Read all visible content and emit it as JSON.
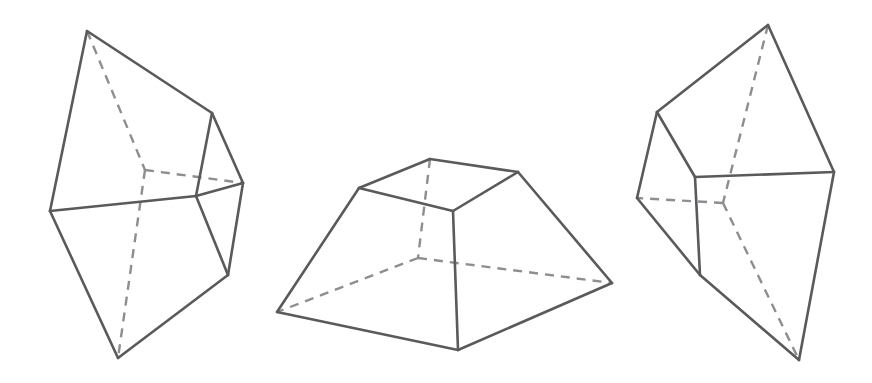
{
  "page": {
    "background_color": "#ffffff",
    "width": 872,
    "height": 383
  },
  "style": {
    "solid_edge_color": "#5a5a5c",
    "hidden_edge_color": "#8e8e92",
    "solid_edge_width": 2.6,
    "hidden_edge_width": 2.4,
    "hidden_dash_pattern": "9 7"
  },
  "figures": [
    {
      "id": "figure-left",
      "name": "left-polyhedron",
      "description": "Truncated pyramid (frustum) tilted, viewed from upper left; bottom apex points down-left",
      "vertices": {
        "top_apex": [
          87,
          31
        ],
        "upper_right": [
          212,
          113
        ],
        "left": [
          50,
          211
        ],
        "right": [
          243,
          183
        ],
        "front_right": [
          228,
          275
        ],
        "bottom_apex": [
          118,
          358
        ],
        "hidden_center": [
          145,
          170
        ],
        "front_mid": [
          196,
          196
        ]
      },
      "solid_edges": [
        [
          [
            87,
            31
          ],
          [
            212,
            113
          ]
        ],
        [
          [
            87,
            31
          ],
          [
            50,
            211
          ]
        ],
        [
          [
            212,
            113
          ],
          [
            243,
            183
          ]
        ],
        [
          [
            50,
            211
          ],
          [
            196,
            196
          ]
        ],
        [
          [
            196,
            196
          ],
          [
            243,
            183
          ]
        ],
        [
          [
            196,
            196
          ],
          [
            212,
            113
          ]
        ],
        [
          [
            50,
            211
          ],
          [
            118,
            358
          ]
        ],
        [
          [
            118,
            358
          ],
          [
            228,
            275
          ]
        ],
        [
          [
            228,
            275
          ],
          [
            243,
            183
          ]
        ],
        [
          [
            196,
            196
          ],
          [
            228,
            275
          ]
        ]
      ],
      "hidden_edges": [
        [
          [
            87,
            31
          ],
          [
            145,
            170
          ]
        ],
        [
          [
            145,
            170
          ],
          [
            243,
            183
          ]
        ],
        [
          [
            145,
            170
          ],
          [
            118,
            358
          ]
        ]
      ]
    },
    {
      "id": "figure-middle",
      "name": "middle-polyhedron",
      "description": "Truncated square pyramid (frustum) resting on its base, viewed slightly from above",
      "vertices": {
        "top_back": [
          430,
          159
        ],
        "top_left": [
          359,
          188
        ],
        "top_right": [
          518,
          172
        ],
        "top_front": [
          453,
          211
        ],
        "bottom_back": [
          418,
          258
        ],
        "bottom_left": [
          277,
          312
        ],
        "bottom_right": [
          612,
          283
        ],
        "bottom_front": [
          458,
          350
        ]
      },
      "solid_edges": [
        [
          [
            359,
            188
          ],
          [
            430,
            159
          ]
        ],
        [
          [
            430,
            159
          ],
          [
            518,
            172
          ]
        ],
        [
          [
            518,
            172
          ],
          [
            453,
            211
          ]
        ],
        [
          [
            453,
            211
          ],
          [
            359,
            188
          ]
        ],
        [
          [
            359,
            188
          ],
          [
            277,
            312
          ]
        ],
        [
          [
            518,
            172
          ],
          [
            612,
            283
          ]
        ],
        [
          [
            453,
            211
          ],
          [
            458,
            350
          ]
        ],
        [
          [
            277,
            312
          ],
          [
            458,
            350
          ]
        ],
        [
          [
            458,
            350
          ],
          [
            612,
            283
          ]
        ]
      ],
      "hidden_edges": [
        [
          [
            430,
            159
          ],
          [
            418,
            258
          ]
        ],
        [
          [
            418,
            258
          ],
          [
            277,
            312
          ]
        ],
        [
          [
            418,
            258
          ],
          [
            612,
            283
          ]
        ]
      ]
    },
    {
      "id": "figure-right",
      "name": "right-polyhedron",
      "description": "Truncated pyramid (frustum) tilted, viewed from upper right; bottom apex points down-right",
      "vertices": {
        "top_apex": [
          768,
          25
        ],
        "upper_left": [
          657,
          112
        ],
        "left": [
          637,
          198
        ],
        "front_left": [
          695,
          177
        ],
        "right": [
          834,
          172
        ],
        "bottom_left": [
          700,
          275
        ],
        "bottom_apex": [
          799,
          360
        ],
        "hidden_center": [
          723,
          203
        ]
      },
      "solid_edges": [
        [
          [
            768,
            25
          ],
          [
            657,
            112
          ]
        ],
        [
          [
            768,
            25
          ],
          [
            834,
            172
          ]
        ],
        [
          [
            657,
            112
          ],
          [
            637,
            198
          ]
        ],
        [
          [
            657,
            112
          ],
          [
            695,
            177
          ]
        ],
        [
          [
            695,
            177
          ],
          [
            834,
            172
          ]
        ],
        [
          [
            637,
            198
          ],
          [
            700,
            275
          ]
        ],
        [
          [
            695,
            177
          ],
          [
            700,
            275
          ]
        ],
        [
          [
            700,
            275
          ],
          [
            799,
            360
          ]
        ],
        [
          [
            799,
            360
          ],
          [
            834,
            172
          ]
        ]
      ],
      "hidden_edges": [
        [
          [
            768,
            25
          ],
          [
            723,
            203
          ]
        ],
        [
          [
            723,
            203
          ],
          [
            637,
            198
          ]
        ],
        [
          [
            723,
            203
          ],
          [
            799,
            360
          ]
        ]
      ]
    }
  ]
}
